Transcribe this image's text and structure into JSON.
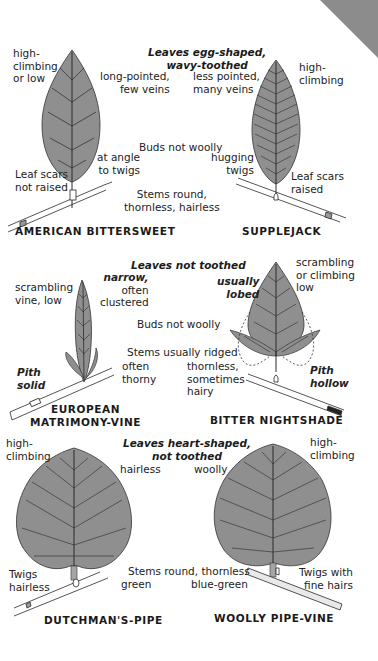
{
  "colors": {
    "leaf_fill": "#8f8f8f",
    "leaf_fill_light": "#a6a6a6",
    "vein": "#2a2a2a",
    "text": "#1a1a1a",
    "corner_tab": "#8c8c8c"
  },
  "section1": {
    "header": [
      "Leaves egg-shaped,",
      "wavy-toothed"
    ],
    "buds": "Buds not woolly",
    "stems": [
      "Stems round,",
      "thornless, hairless"
    ],
    "left": {
      "name": "AMERICAN BITTERSWEET",
      "habit": [
        "high-",
        "climbing",
        "or low"
      ],
      "leaf": [
        "long-pointed,",
        "few veins"
      ],
      "buds_detail": [
        "at angle",
        "to twigs"
      ],
      "scars": [
        "Leaf scars",
        "not raised"
      ]
    },
    "right": {
      "name": "SUPPLEJACK",
      "habit": [
        "high-",
        "climbing"
      ],
      "leaf": [
        "less pointed,",
        "many veins"
      ],
      "buds_detail": [
        "hugging",
        "twigs"
      ],
      "scars": [
        "Leaf scars",
        "raised"
      ]
    }
  },
  "section2": {
    "header": "Leaves not toothed",
    "buds": "Buds not woolly",
    "stems": "Stems usually ridged",
    "left": {
      "name": [
        "EUROPEAN",
        "MATRIMONY-VINE"
      ],
      "habit": [
        "scrambling",
        "vine, low"
      ],
      "leaf": [
        "narrow,",
        "often",
        "clustered"
      ],
      "stem_detail": [
        "often",
        "thorny"
      ],
      "pith": [
        "Pith",
        "solid"
      ]
    },
    "right": {
      "name": "BITTER NIGHTSHADE",
      "habit": [
        "scrambling",
        "or climbing",
        "low"
      ],
      "leaf": [
        "usually",
        "lobed"
      ],
      "buds_detail": "woolly",
      "stem_detail": [
        "thornless,",
        "sometimes",
        "hairy"
      ],
      "pith": [
        "Pith",
        "hollow"
      ]
    }
  },
  "section3": {
    "header": [
      "Leaves heart-shaped,",
      "not toothed"
    ],
    "stems": "Stems round, thornless",
    "left": {
      "name": "DUTCHMAN'S-PIPE",
      "habit": [
        "high-",
        "climbing"
      ],
      "leaf": "hairless",
      "stem_detail": "green",
      "twigs": [
        "Twigs",
        "hairless"
      ]
    },
    "right": {
      "name": "WOOLLY PIPE-VINE",
      "habit": [
        "high-",
        "climbing"
      ],
      "leaf": "woolly",
      "stem_detail": "blue-green",
      "twigs": [
        "Twigs with",
        "fine hairs"
      ]
    }
  }
}
